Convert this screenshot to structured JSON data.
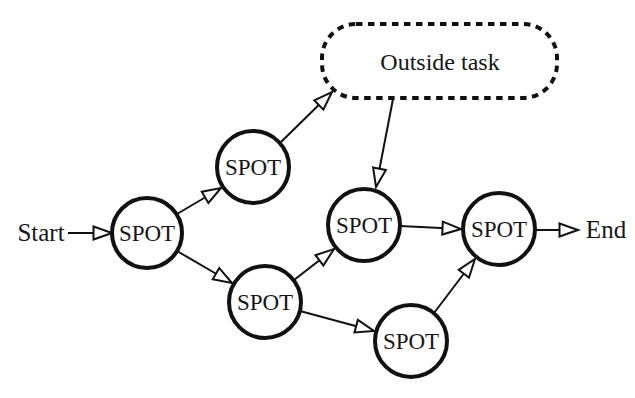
{
  "diagram": {
    "type": "workflow-graph",
    "start_label": "Start",
    "end_label": "End",
    "outside_task": {
      "label": "Outside task",
      "border_style": "dashed"
    },
    "spot_nodes": [
      {
        "id": "spot-1",
        "label": "SPOT"
      },
      {
        "id": "spot-2",
        "label": "SPOT"
      },
      {
        "id": "spot-3",
        "label": "SPOT"
      },
      {
        "id": "spot-4",
        "label": "SPOT"
      },
      {
        "id": "spot-5",
        "label": "SPOT"
      },
      {
        "id": "spot-6",
        "label": "SPOT"
      }
    ],
    "edges": [
      {
        "from": "start",
        "to": "spot-1"
      },
      {
        "from": "spot-1",
        "to": "spot-2"
      },
      {
        "from": "spot-2",
        "to": "outside-task"
      },
      {
        "from": "outside-task",
        "to": "spot-4"
      },
      {
        "from": "spot-1",
        "to": "spot-3"
      },
      {
        "from": "spot-3",
        "to": "spot-4"
      },
      {
        "from": "spot-3",
        "to": "spot-5"
      },
      {
        "from": "spot-4",
        "to": "spot-6"
      },
      {
        "from": "spot-5",
        "to": "spot-6"
      },
      {
        "from": "spot-6",
        "to": "end"
      }
    ],
    "colors": {
      "ink": "#111111",
      "background": "#ffffff"
    }
  }
}
